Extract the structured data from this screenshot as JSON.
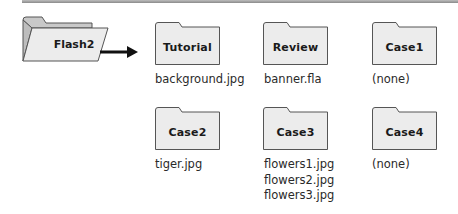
{
  "diagram": {
    "type": "folder-structure",
    "root": {
      "label": "Flash2",
      "icon": "open-folder-icon"
    },
    "colors": {
      "folder_fill": "#ececec",
      "folder_stroke": "#555555",
      "open_folder_back": "#c8c8c8",
      "arrow": "#111111",
      "rule": "#9a9a9a"
    },
    "subfolders": [
      {
        "label": "Tutorial",
        "files": [
          "background.jpg"
        ]
      },
      {
        "label": "Review",
        "files": [
          "banner.fla"
        ]
      },
      {
        "label": "Case1",
        "files": [
          "(none)"
        ]
      },
      {
        "label": "Case2",
        "files": [
          "tiger.jpg"
        ]
      },
      {
        "label": "Case3",
        "files": [
          "flowers1.jpg",
          "flowers2.jpg",
          "flowers3.jpg"
        ]
      },
      {
        "label": "Case4",
        "files": [
          "(none)"
        ]
      }
    ]
  }
}
